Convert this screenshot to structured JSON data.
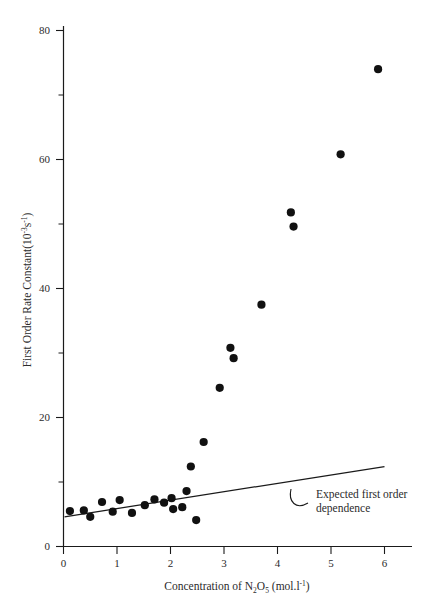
{
  "chart_data": {
    "type": "scatter",
    "title": "",
    "xlabel": "Concentration of N2O5 (mol.l-1)",
    "xlabel_parts": {
      "prefix": "Concentration of N",
      "sub1": "2",
      "mid": "O",
      "sub2": "5",
      "unit_open": " (mol.l",
      "sup1": "-1",
      "unit_close": ")"
    },
    "ylabel": "First Order Rate Constant(10-3s-1)",
    "ylabel_parts": {
      "prefix": "First Order Rate Constant(10",
      "sup1": "-3",
      "mid": "s",
      "sup2": "-1",
      "suffix": ")"
    },
    "xlim": [
      0,
      6.45
    ],
    "ylim": [
      0,
      82
    ],
    "xticks": [
      0,
      1,
      2,
      3,
      4,
      5,
      6
    ],
    "xtick_labels": [
      "0",
      "1",
      "2",
      "3",
      "4",
      "5",
      "6"
    ],
    "yticks": [
      0,
      20,
      40,
      60,
      80
    ],
    "ytick_labels": [
      "0",
      "20",
      "40",
      "60",
      "80"
    ],
    "yticks_minor": [
      10,
      30,
      50,
      70
    ],
    "grid": false,
    "legend": "none",
    "marker": "filled-circle",
    "marker_color": "#111111",
    "series": [
      {
        "name": "Measured rate constants",
        "points": [
          [
            0.12,
            5.5
          ],
          [
            0.38,
            5.6
          ],
          [
            0.5,
            4.6
          ],
          [
            0.72,
            6.9
          ],
          [
            0.92,
            5.4
          ],
          [
            1.05,
            7.2
          ],
          [
            1.28,
            5.2
          ],
          [
            1.52,
            6.4
          ],
          [
            1.7,
            7.3
          ],
          [
            1.88,
            6.8
          ],
          [
            2.02,
            7.5
          ],
          [
            2.05,
            5.8
          ],
          [
            2.22,
            6.1
          ],
          [
            2.3,
            8.6
          ],
          [
            2.38,
            12.4
          ],
          [
            2.48,
            4.1
          ],
          [
            2.62,
            16.2
          ],
          [
            2.92,
            24.6
          ],
          [
            3.12,
            30.8
          ],
          [
            3.18,
            29.2
          ],
          [
            3.7,
            37.5
          ],
          [
            4.25,
            51.8
          ],
          [
            4.3,
            49.6
          ],
          [
            5.18,
            60.8
          ],
          [
            5.88,
            74.0
          ]
        ]
      }
    ],
    "trend_line": {
      "label": "Expected first order dependence",
      "x_start": 0.02,
      "y_start": 4.6,
      "x_end": 6.0,
      "y_end": 12.4,
      "style": "solid",
      "color": "#1a1a1a"
    },
    "annotations": [
      {
        "name": "expected-first-order-dependence",
        "line1": "Expected first order",
        "line2": "dependence",
        "pointer": "curved-arc"
      }
    ]
  }
}
